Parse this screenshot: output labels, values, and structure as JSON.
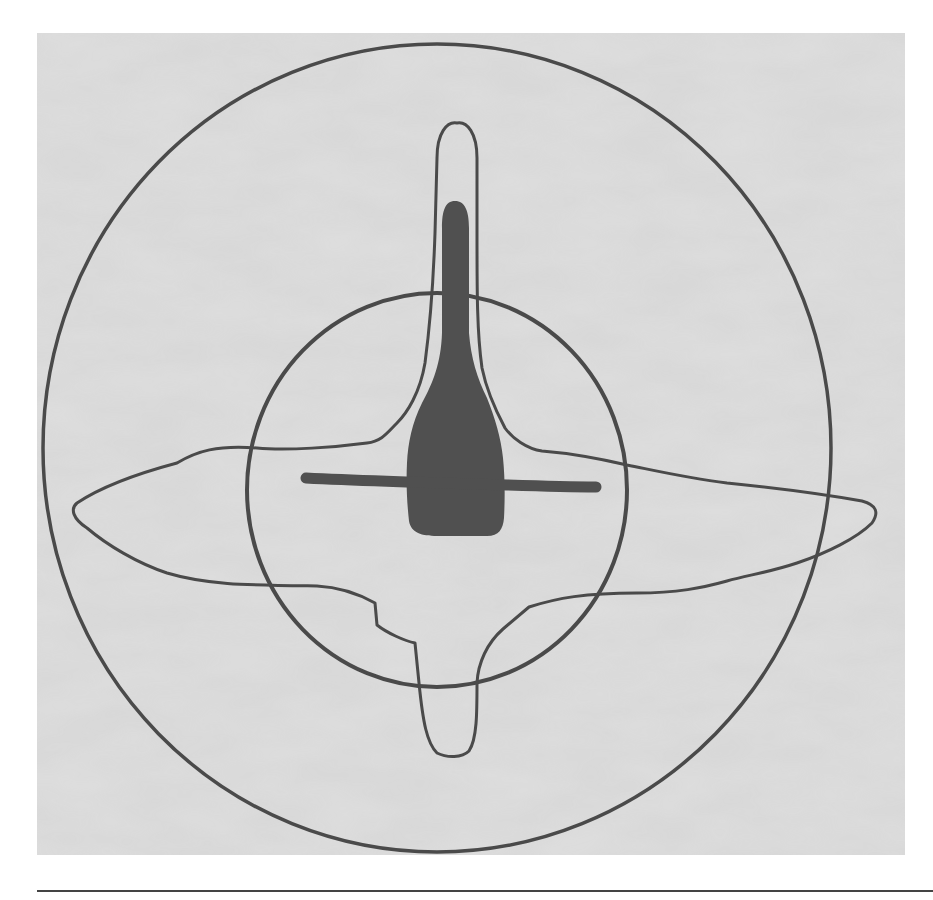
{
  "figure": {
    "colors": {
      "paper": "#dcdcdc",
      "paper_shadow": "#c8c8c8",
      "line": "#4a4a4a",
      "fill": "#505050",
      "rule": "#444444"
    },
    "shapes": {
      "outer_ellipse": {
        "cx": 400,
        "cy": 415,
        "rx": 394,
        "ry": 405
      },
      "inner_circle": {
        "cx": 400,
        "cy": 457,
        "rx": 190,
        "ry": 197
      },
      "central_body": "dark club shape",
      "crossbar": "horizontal dark bar",
      "outline": "thin outline with top spike, bottom spike, left and right wings"
    }
  }
}
